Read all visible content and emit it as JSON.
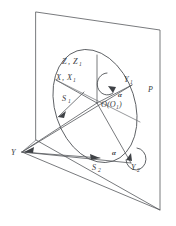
{
  "figure": {
    "background_color": "#ffffff",
    "line_color": "#55585c",
    "label_color": "#3b3e42"
  },
  "labels": {
    "plane": "P",
    "axis_z": "Z",
    "axis_z_sub": "Z",
    "axis_z_sub_index": "1",
    "axis_x": "X",
    "axis_x_sub": "X",
    "axis_x_sub_index": "1",
    "axis_y1": "Y",
    "axis_y1_index": "1",
    "axis_y2": "Y",
    "axis_y2_index": "2",
    "vertex_y": "Y",
    "origin": "O(O",
    "origin_index": "1",
    "origin_close": ")",
    "vector_s1": "S",
    "vector_s1_index": "1",
    "vector_s2": "S",
    "vector_s2_index": "2",
    "angle_alpha_upper": "α",
    "angle_alpha_lower": "α"
  },
  "geometry": {
    "plane_corners": "36,12 160,30 160,210 36,140",
    "ellipse_center_x": 95,
    "ellipse_center_y": 106,
    "ellipse_rx": 40,
    "ellipse_ry": 58,
    "ellipse_rotation_deg": -18,
    "origin_x": 97,
    "origin_y": 103,
    "vertex_y_x": 22,
    "vertex_y_y": 152
  }
}
